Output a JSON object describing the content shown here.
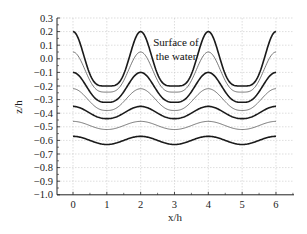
{
  "chart_data": {
    "type": "line",
    "title": "",
    "xlabel": "x/h",
    "ylabel": "z/h",
    "xlim": [
      0,
      6
    ],
    "ylim": [
      -1.0,
      0.3
    ],
    "xticks": [
      "0",
      "1",
      "2",
      "3",
      "4",
      "5",
      "6"
    ],
    "yticks": [
      "0.3",
      "0.2",
      "0.1",
      "0.0",
      "−0.1",
      "−0.2",
      "−0.3",
      "−0.4",
      "−0.5",
      "−0.6",
      "−0.7",
      "−0.8",
      "−0.9",
      "−1.0"
    ],
    "grid": true,
    "legend": null,
    "annotations": [
      {
        "text_line1": "Surface of",
        "text_line2": "the water",
        "x": 3,
        "y": 0.1
      }
    ],
    "series": [
      {
        "name": "surface",
        "style": "thick",
        "peak": 0.2,
        "trough": -0.2,
        "sharpness": 2.2
      },
      {
        "name": "level-2",
        "style": "thin",
        "peak": 0.05,
        "trough": -0.245,
        "sharpness": 1.8
      },
      {
        "name": "level-3",
        "style": "thick",
        "peak": -0.1,
        "trough": -0.32,
        "sharpness": 1.5
      },
      {
        "name": "level-4",
        "style": "thin",
        "peak": -0.22,
        "trough": -0.38,
        "sharpness": 1.3
      },
      {
        "name": "level-5",
        "style": "thick",
        "peak": -0.35,
        "trough": -0.44,
        "sharpness": 1.15
      },
      {
        "name": "level-6",
        "style": "thin",
        "peak": -0.46,
        "trough": -0.52,
        "sharpness": 1.05
      },
      {
        "name": "level-7",
        "style": "thick",
        "peak": -0.57,
        "trough": -0.63,
        "sharpness": 1.0
      }
    ],
    "period": 2,
    "peaks_at_x": [
      0,
      2,
      4,
      6
    ],
    "troughs_at_x": [
      1,
      3,
      5
    ]
  },
  "colors": {
    "axis": "#222222",
    "grid": "#c8c8c8",
    "thick_line": "#1a1a1a",
    "thin_line": "#555555"
  },
  "labels": {
    "xlabel": "x/h",
    "ylabel": "z/h",
    "annotation_line1": "Surface of",
    "annotation_line2": "the water"
  }
}
